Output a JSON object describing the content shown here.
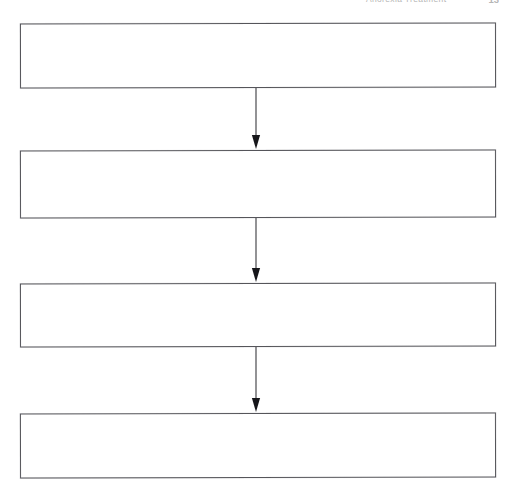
{
  "page": {
    "width": 515,
    "height": 494,
    "background_color": "#ffffff",
    "kind": "scanned-document-page"
  },
  "header": {
    "title": "Anorexia Treatment",
    "page_number": "13",
    "clipped": true,
    "color": "#9a9a9a"
  },
  "diagram": {
    "type": "flowchart",
    "orientation": "vertical-top-to-bottom",
    "node_count": 4,
    "connector_count": 3,
    "border_color": "#55555a",
    "fill_color": "#ffffff",
    "nodes": [
      {
        "id": "node-1",
        "label": "",
        "x": 20,
        "y": 23,
        "width": 476,
        "height": 65
      },
      {
        "id": "node-2",
        "label": "",
        "x": 20,
        "y": 150,
        "width": 476,
        "height": 68
      },
      {
        "id": "node-3",
        "label": "",
        "x": 20,
        "y": 283,
        "width": 476,
        "height": 64
      },
      {
        "id": "node-4",
        "label": "",
        "x": 20,
        "y": 413,
        "width": 476,
        "height": 65
      }
    ],
    "connectors": [
      {
        "id": "conn-1",
        "from": "node-1",
        "to": "node-2",
        "label": "",
        "arrowhead": "solid-triangle",
        "x": 256
      },
      {
        "id": "conn-2",
        "from": "node-2",
        "to": "node-3",
        "label": "",
        "arrowhead": "solid-triangle",
        "x": 256
      },
      {
        "id": "conn-3",
        "from": "node-3",
        "to": "node-4",
        "label": "",
        "arrowhead": "solid-triangle",
        "x": 256
      }
    ]
  }
}
